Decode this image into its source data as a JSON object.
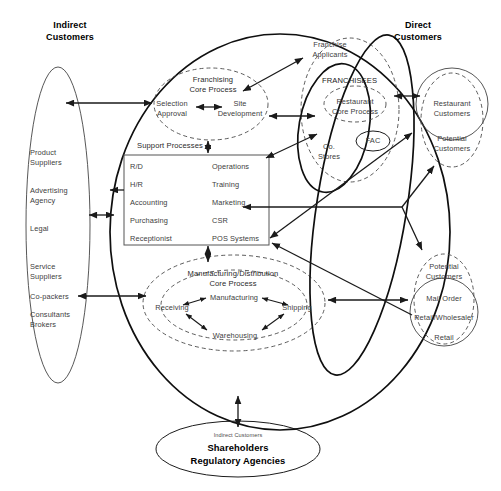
{
  "diagram": {
    "title_left": "Indirect\nCustomers",
    "title_right": "Direct\nCustomers",
    "suppliers": {
      "items": [
        "Product\nSuppliers",
        "Advertising\nAgency",
        "Legal",
        "Service\nSuppliers",
        "Co-packers",
        "Consultants\nBrokers"
      ]
    },
    "franchising": {
      "title": "Franchising\nCore Process",
      "nodes": [
        "Selection\nApproval",
        "Site\nDevelopment"
      ]
    },
    "support": {
      "caption": "Support Processes",
      "left_column": [
        "R/D",
        "H/R",
        "Accounting",
        "Purchasing",
        "Receptionist"
      ],
      "right_column": [
        "Operations",
        "Training",
        "Marketing",
        "CSR",
        "POS Systems"
      ]
    },
    "manufacturing": {
      "title": "Manufacturing/Distribution\nCore Process",
      "nodes": [
        "Receiving",
        "Manufacturing",
        "Shipping",
        "Warehousing"
      ]
    },
    "franchisees": {
      "label": "FRANCHISEES",
      "core_process": "Restaurant\nCore Process",
      "fac": "FAC",
      "co_stores": "Co.\nStores",
      "applicants": "Franchise\nApplicants"
    },
    "right_customers": {
      "restaurant": "Restaurant\nCustomers",
      "potential_top": "Potential\nCustomers",
      "potential_bottom": "Potential\nCustomers",
      "channels": [
        "Mail Order",
        "Retail/Wholesaler",
        "Retail"
      ]
    },
    "bottom": {
      "small_label": "Indirect Customers",
      "line1": "Shareholders",
      "line2": "Regulatory Agencies"
    },
    "colors": {
      "stroke": "#1c1c1c",
      "text": "#3d3d3d",
      "dashed": "#4a4a4a",
      "background": "#ffffff"
    }
  }
}
